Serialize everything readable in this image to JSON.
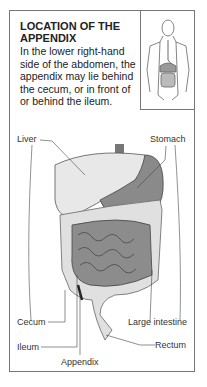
{
  "title": "LOCATION OF THE APPENDIX",
  "description": "In the lower right-hand side of the abdomen, the appendix may lie behind the cecum, or in front of or behind the ileum.",
  "labels": {
    "liver": "Liver",
    "stomach": "Stomach",
    "cecum": "Cecum",
    "large_intestine": "Large intestine",
    "ileum": "Ileum",
    "rectum": "Rectum",
    "appendix": "Appendix"
  },
  "colors": {
    "liver": "#e8e8e8",
    "stomach": "#8a8a8a",
    "small_intestine": "#8c8c8c",
    "large_intestine": "#e0e0e0",
    "outline": "#555555"
  }
}
